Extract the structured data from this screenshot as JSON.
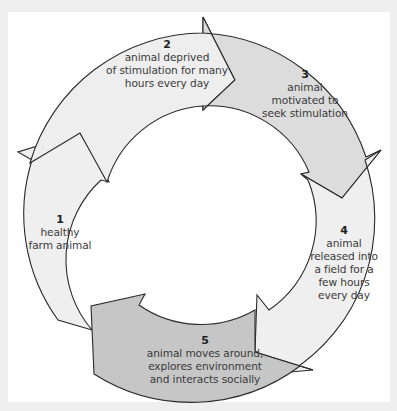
{
  "diagram": {
    "type": "cycle",
    "colors": {
      "frame": "#efefef",
      "panel": "#ffffff",
      "arrow_light": "#ededed",
      "arrow_mid": "#dcdcdc",
      "arrow_dark": "#c6c6c6",
      "outline": "#2a2a2a",
      "text": "#3a3a3a"
    },
    "steps": [
      {
        "number": "1",
        "text": "healthy\nfarm animal"
      },
      {
        "number": "2",
        "text": "animal deprived\nof stimulation for many\nhours every day"
      },
      {
        "number": "3",
        "text": "animal\nmotivated to\nseek stimulation"
      },
      {
        "number": "4",
        "text": "animal\nreleased into\na field for a\nfew hours\nevery day"
      },
      {
        "number": "5",
        "text": "animal moves around,\nexplores environment\nand interacts socially"
      }
    ]
  }
}
